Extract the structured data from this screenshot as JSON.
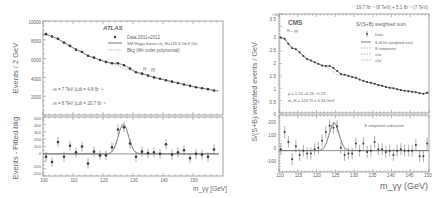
{
  "chart_data": [
    {
      "type": "scatter",
      "experiment": "ATLAS",
      "title": "ATLAS",
      "channel_label": "H→γγ",
      "xlabel": "m_γγ [GeV]",
      "ylabel_top": "Events / 2 GeV",
      "ylabel_bottom": "Events - Fitted bkg",
      "xlim": [
        100,
        160
      ],
      "ylim_top": [
        0,
        10000
      ],
      "ylim_bottom": [
        -300,
        500
      ],
      "xticks": [
        "100",
        "110",
        "120",
        "130",
        "140",
        "150"
      ],
      "yticks_top": [
        "2000",
        "4000",
        "6000",
        "8000",
        "10000"
      ],
      "yticks_bottom": [
        "-200",
        "-100",
        "0",
        "100",
        "200",
        "300",
        "400",
        "500"
      ],
      "legend": [
        {
          "marker": "point",
          "label": "Data 2011+2012"
        },
        {
          "marker": "solid-line",
          "label": "SM Higgs boson m_H=126.8 GeV (fit)"
        },
        {
          "marker": "dashed-line",
          "label": "Bkg (4th order polynomial)"
        }
      ],
      "annotations": [
        "√s = 7 TeV ∫Ldt = 4.8 fb⁻¹",
        "√s = 8 TeV ∫Ldt = 20.7 fb⁻¹"
      ],
      "x": [
        101,
        103,
        105,
        107,
        109,
        111,
        113,
        115,
        117,
        119,
        121,
        123,
        125,
        127,
        129,
        131,
        133,
        135,
        137,
        139,
        141,
        143,
        145,
        147,
        149,
        151,
        153,
        155,
        157,
        159
      ],
      "series": [
        {
          "name": "Data (events / 2 GeV)",
          "values": [
            8600,
            8350,
            8100,
            7700,
            7350,
            6950,
            6700,
            6300,
            6100,
            5850,
            5650,
            5500,
            5500,
            5300,
            4950,
            4550,
            4400,
            4200,
            4000,
            3850,
            3700,
            3550,
            3400,
            3250,
            3100,
            2950,
            2850,
            2750,
            2600,
            2550
          ]
        },
        {
          "name": "Data - fitted bkg",
          "values": [
            -40,
            -110,
            160,
            -40,
            110,
            20,
            100,
            -130,
            30,
            -20,
            -20,
            90,
            330,
            360,
            140,
            -40,
            30,
            10,
            20,
            0,
            130,
            -10,
            20,
            50,
            -60,
            0,
            -10,
            -40,
            60,
            -30
          ]
        }
      ]
    },
    {
      "type": "scatter",
      "experiment": "CMS",
      "title": "CMS",
      "channel_label": "H→γγ",
      "luminosity": "19.7 fb⁻¹ (8 TeV) + 5.1 fb⁻¹ (7 TeV)",
      "xlabel": "m_γγ (GeV)",
      "ylabel_top": "S/(S+B) weighted events / GeV",
      "y_multiplier": "×10³",
      "xlim": [
        110,
        150
      ],
      "ylim_top": [
        0,
        4000
      ],
      "ylim_bottom": [
        -150,
        250
      ],
      "xticks": [
        "110",
        "115",
        "120",
        "125",
        "130",
        "135",
        "140",
        "145",
        "150"
      ],
      "yticks_top": [
        "0",
        "0.5",
        "1",
        "1.5",
        "2",
        "2.5",
        "3",
        "3.5"
      ],
      "yticks_bottom": [
        "-100",
        "0",
        "100",
        "200"
      ],
      "legend_title": "S/(S+B) weighted sum",
      "legend": [
        {
          "marker": "point",
          "label": "Data"
        },
        {
          "marker": "solid-line",
          "label": "S+B fits (weighted sum)"
        },
        {
          "marker": "dashed-line",
          "label": "B component"
        },
        {
          "marker": "band",
          "label": "±1σ"
        },
        {
          "marker": "band",
          "label": "±2σ"
        }
      ],
      "annotations": [
        "μ̂ = 1.14 +0.26 −0.23",
        "m_H = 124.70 ± 0.34 GeV",
        "B component subtracted"
      ],
      "x": [
        110.5,
        111.5,
        112.5,
        113.5,
        114.5,
        115.5,
        116.5,
        117.5,
        118.5,
        119.5,
        120.5,
        121.5,
        122.5,
        123.5,
        124.5,
        125.5,
        126.5,
        127.5,
        128.5,
        129.5,
        130.5,
        131.5,
        132.5,
        133.5,
        134.5,
        135.5,
        136.5,
        137.5,
        138.5,
        139.5,
        140.5,
        141.5,
        142.5,
        143.5,
        144.5,
        145.5,
        146.5,
        147.5,
        148.5,
        149.5
      ],
      "series": [
        {
          "name": "Data (×10³ weighted events / GeV)",
          "values": [
            3.05,
            3.0,
            2.8,
            2.62,
            2.58,
            2.45,
            2.3,
            2.18,
            2.12,
            2.05,
            1.98,
            1.92,
            1.9,
            1.9,
            1.82,
            1.7,
            1.58,
            1.55,
            1.5,
            1.45,
            1.42,
            1.35,
            1.3,
            1.25,
            1.22,
            1.18,
            1.13,
            1.1,
            1.05,
            1.02,
            1.0,
            0.96,
            0.93,
            0.9,
            0.88,
            0.86,
            0.84,
            0.8,
            0.78,
            0.82
          ]
        },
        {
          "name": "Data - B component",
          "values": [
            10,
            130,
            60,
            -60,
            30,
            -30,
            0,
            -20,
            -20,
            10,
            20,
            70,
            130,
            175,
            160,
            170,
            20,
            -30,
            -20,
            -20,
            50,
            0,
            50,
            -10,
            0,
            60,
            10,
            10,
            -10,
            0,
            -30,
            0,
            10,
            0,
            0,
            0,
            40,
            -40,
            -40,
            50
          ]
        }
      ]
    }
  ]
}
